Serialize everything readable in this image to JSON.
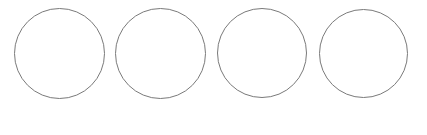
{
  "canvas": {
    "width": 427,
    "height": 135,
    "background": "#ffffff"
  },
  "style": {
    "stroke_color": "#7a7a7a",
    "fill_color": "#ffffff"
  },
  "circles": [
    {
      "id": "circle-1",
      "cx": 59,
      "cy": 53,
      "diameter": 91,
      "label": ""
    },
    {
      "id": "circle-2",
      "cx": 160,
      "cy": 53,
      "diameter": 91,
      "label": ""
    },
    {
      "id": "circle-3",
      "cx": 262,
      "cy": 53,
      "diameter": 90,
      "label": ""
    },
    {
      "id": "circle-4",
      "cx": 363,
      "cy": 53,
      "diameter": 89,
      "label": ""
    }
  ]
}
